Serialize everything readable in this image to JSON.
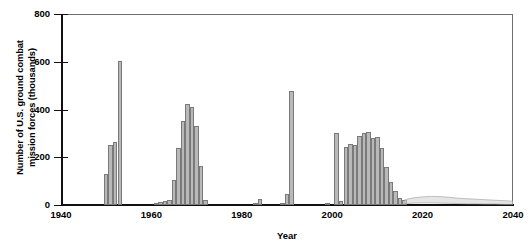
{
  "chart_data": {
    "type": "bar",
    "title": "",
    "xlabel": "Year",
    "ylabel": "Number of U.S. ground combat\nmission forces (thousands)",
    "xlim": [
      1940,
      2040
    ],
    "ylim": [
      0,
      800
    ],
    "xticks": [
      1940,
      1960,
      1980,
      2000,
      2020,
      2040
    ],
    "yticks": [
      0,
      200,
      400,
      600,
      800
    ],
    "grid": false,
    "legend": null,
    "bar_color": "#b9b9b9",
    "bar_edge_color": "#7a7a7a",
    "axis_color": "#111111",
    "frame_color": "#6e6e6e",
    "projection_color": "#cfcfcf",
    "categories": [
      1950,
      1951,
      1952,
      1953,
      1961,
      1962,
      1963,
      1964,
      1965,
      1966,
      1967,
      1968,
      1969,
      1970,
      1971,
      1972,
      1983,
      1984,
      1989,
      1990,
      1991,
      1999,
      2001,
      2002,
      2003,
      2004,
      2005,
      2006,
      2007,
      2008,
      2009,
      2010,
      2011,
      2012,
      2013,
      2014,
      2015,
      2016
    ],
    "values": [
      128,
      253,
      266,
      605,
      5,
      13,
      15,
      21,
      105,
      239,
      352,
      425,
      412,
      332,
      163,
      20,
      5,
      25,
      3,
      48,
      478,
      6,
      300,
      18,
      245,
      255,
      252,
      288,
      300,
      305,
      282,
      285,
      240,
      160,
      95,
      60,
      30,
      20
    ],
    "projection": {
      "label": "",
      "x_start": 2016,
      "x_end": 2040,
      "upper_values": [
        22,
        30,
        34,
        36,
        35,
        32,
        28,
        26,
        24,
        22,
        20,
        18,
        16
      ],
      "lower_values": [
        6,
        8,
        9,
        9,
        8,
        7,
        6,
        5,
        5,
        4,
        4,
        3,
        3
      ]
    }
  },
  "axis": {
    "y_title": "Number of U.S. ground combat\nmission forces (thousands)",
    "x_title": "Year",
    "ytick_labels": [
      "800",
      "600",
      "400",
      "200",
      "0"
    ],
    "xtick_labels": [
      "1940",
      "1960",
      "1980",
      "2000",
      "2020",
      "2040"
    ]
  }
}
